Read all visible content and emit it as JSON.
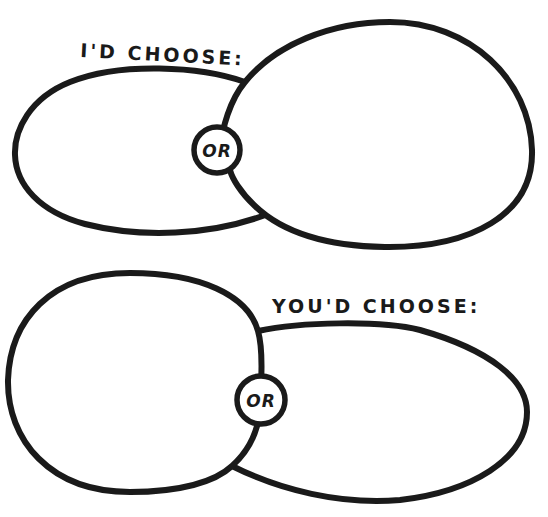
{
  "diagram": {
    "type": "either-or choice worksheet",
    "colors": {
      "ink": "#1a1a1a",
      "paper": "#ffffff"
    },
    "top_panel": {
      "label": "I'D CHOOSE:",
      "connector": "OR",
      "left_shape": "horizontal oval (blank)",
      "right_shape": "large round bubble (blank)"
    },
    "bottom_panel": {
      "label": "YOU'D CHOOSE:",
      "connector": "OR",
      "left_shape": "large round bubble (blank)",
      "right_shape": "horizontal oval (blank)"
    }
  }
}
